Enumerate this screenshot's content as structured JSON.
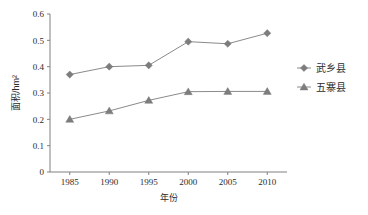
{
  "chart_data": {
    "type": "line",
    "title": "",
    "xlabel": "年份",
    "ylabel": "面积/hm²",
    "categories": [
      "1985",
      "1990",
      "1995",
      "2000",
      "2005",
      "2010"
    ],
    "x": [
      1985,
      1990,
      1995,
      2000,
      2005,
      2010
    ],
    "xlim": [
      1982.5,
      2012.5
    ],
    "ylim": [
      0,
      0.6
    ],
    "yticks": [
      "0",
      "0.1",
      "0.2",
      "0.3",
      "0.4",
      "0.5",
      "0.6"
    ],
    "ytick_values": [
      0,
      0.1,
      0.2,
      0.3,
      0.4,
      0.5,
      0.6
    ],
    "grid": false,
    "legend_position": "right",
    "series": [
      {
        "name": "武乡县",
        "marker": "diamond",
        "color": "#7d7d7d",
        "values": [
          0.37,
          0.4,
          0.405,
          0.495,
          0.487,
          0.527
        ]
      },
      {
        "name": "五寨县",
        "marker": "triangle",
        "color": "#7d7d7d",
        "values": [
          0.2,
          0.232,
          0.272,
          0.305,
          0.306,
          0.306
        ]
      }
    ]
  },
  "legend": {
    "items": [
      {
        "label": "武乡县",
        "marker": "diamond"
      },
      {
        "label": "五寨县",
        "marker": "triangle"
      }
    ]
  },
  "colors": {
    "axis": "#808080",
    "series": "#7d7d7d",
    "text": "#2b2b2b",
    "background": "#ffffff"
  }
}
